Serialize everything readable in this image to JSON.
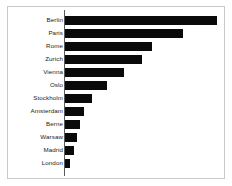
{
  "frame": {
    "border_color": "#c9c9c9",
    "background_color": "#ffffff"
  },
  "axis": {
    "color": "#5a5a5a",
    "orientation": "vertical-left"
  },
  "chart_data": {
    "type": "bar",
    "orientation": "horizontal",
    "title": "",
    "subtitle": "",
    "xlabel": "",
    "ylabel": "",
    "grid": false,
    "legend": false,
    "bar_color": "#0a0a0a",
    "xlim": [
      0,
      160
    ],
    "categories": [
      "Berlin",
      "Paris",
      "Rome",
      "Zurich",
      "Vienna",
      "Oslo",
      "Stockholm",
      "Amsterdam",
      "Berne",
      "Warsaw",
      "Madrid",
      "London"
    ],
    "values": [
      152,
      118,
      87,
      77,
      59,
      42,
      27,
      19,
      15,
      12,
      9,
      5
    ],
    "tick_labels": [
      "Berlin",
      "Paris",
      "Rome",
      "Zurich",
      "Vienna",
      "Oslo",
      "Stockholm",
      "Amsterdam",
      "Berne",
      "Warsaw",
      "Madrid",
      "London"
    ],
    "annotations": []
  },
  "bars": [
    {
      "label": "Berlin",
      "value": 152,
      "top": 7,
      "width": 152
    },
    {
      "label": "Paris",
      "value": 118,
      "top": 20,
      "width": 118
    },
    {
      "label": "Rome",
      "value": 87,
      "top": 33,
      "width": 87
    },
    {
      "label": "Zurich",
      "value": 77,
      "top": 46,
      "width": 77
    },
    {
      "label": "Vienna",
      "value": 59,
      "top": 59,
      "width": 59
    },
    {
      "label": "Oslo",
      "value": 42,
      "top": 72,
      "width": 42
    },
    {
      "label": "Stockholm",
      "value": 27,
      "top": 85,
      "width": 27
    },
    {
      "label": "Amsterdam",
      "value": 19,
      "top": 98,
      "width": 19
    },
    {
      "label": "Berne",
      "value": 15,
      "top": 111,
      "width": 15
    },
    {
      "label": "Warsaw",
      "value": 12,
      "top": 124,
      "width": 12
    },
    {
      "label": "Madrid",
      "value": 9,
      "top": 137,
      "width": 9
    },
    {
      "label": "London",
      "value": 5,
      "top": 150,
      "width": 5
    }
  ]
}
